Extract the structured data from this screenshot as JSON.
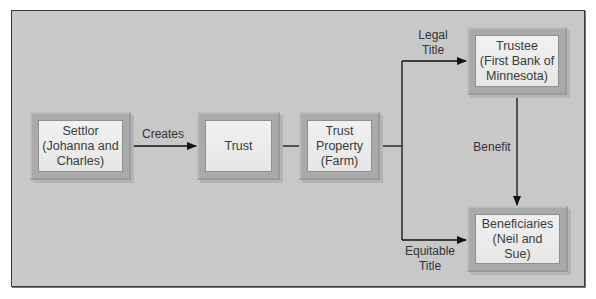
{
  "diagram": {
    "nodes": {
      "settlor": {
        "lines": [
          "Settlor",
          "(Johanna and",
          "Charles)"
        ]
      },
      "trust": {
        "lines": [
          "Trust"
        ]
      },
      "trust_property": {
        "lines": [
          "Trust",
          "Property",
          "(Farm)"
        ]
      },
      "trustee": {
        "lines": [
          "Trustee",
          "(First Bank of",
          "Minnesota)"
        ]
      },
      "beneficiaries": {
        "lines": [
          "Beneficiaries",
          "(Neil and",
          "Sue)"
        ]
      }
    },
    "edges": {
      "creates": "Creates",
      "legal_title": [
        "Legal",
        "Title"
      ],
      "equitable_title": [
        "Equitable",
        "Title"
      ],
      "benefit": "Benefit"
    }
  }
}
